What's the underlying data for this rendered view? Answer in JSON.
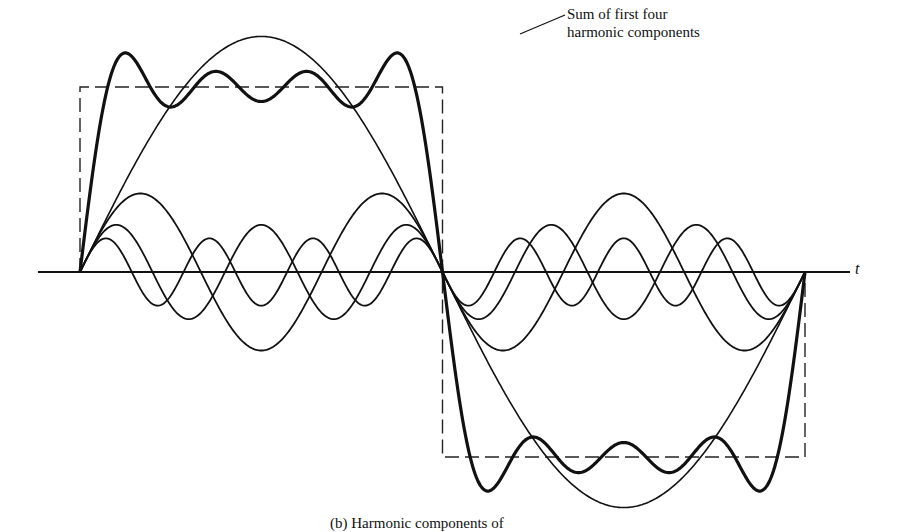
{
  "chart_data": {
    "type": "line",
    "title": "",
    "xlabel": "t",
    "ylabel": "",
    "grid": false,
    "legend": null,
    "annotation": {
      "line1": "Sum of first four",
      "line2": "harmonic components"
    },
    "caption": "(b)  Harmonic components of",
    "x_range": [
      0,
      1
    ],
    "period": 1,
    "series": [
      {
        "name": "Square wave",
        "style": "dashed",
        "amplitude": 1.0
      },
      {
        "name": "Fundamental (n=1)",
        "style": "thin",
        "amplitude": 1.273
      },
      {
        "name": "3rd harmonic",
        "style": "thin",
        "amplitude": 0.424
      },
      {
        "name": "5th harmonic",
        "style": "thin",
        "amplitude": 0.255
      },
      {
        "name": "7th harmonic",
        "style": "thin",
        "amplitude": 0.182
      },
      {
        "name": "Sum of first four harmonic components",
        "style": "bold",
        "harmonics": [
          1,
          3,
          5,
          7
        ]
      }
    ]
  },
  "layout": {
    "axis_y": 272,
    "x_start": 80,
    "x_end": 805,
    "unit_amplitude_px": 185,
    "axis_x_left": 38,
    "axis_x_right": 850
  }
}
